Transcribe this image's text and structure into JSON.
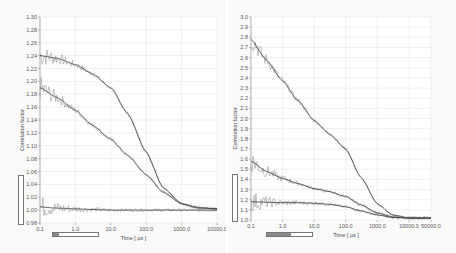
{
  "chart_data": [
    {
      "type": "line",
      "title": "",
      "xlabel": "Time [ µs ]",
      "ylabel": "Correlation factor",
      "xscale": "log",
      "xlim": [
        0.1,
        10000.0
      ],
      "ylim": [
        0.98,
        1.3
      ],
      "grid": true,
      "legend": "none",
      "x_ticks": [
        "0.1",
        "1.0",
        "10.0",
        "100.0",
        "1000.0",
        "10000.0"
      ],
      "y_ticks": [
        "1.30",
        "1.28",
        "1.26",
        "1.24",
        "1.22",
        "1.20",
        "1.18",
        "1.16",
        "1.14",
        "1.12",
        "1.10",
        "1.08",
        "1.06",
        "1.04",
        "1.02",
        "1.00",
        "0.98"
      ],
      "x": [
        0.1,
        0.3,
        1.0,
        3.0,
        10.0,
        30.0,
        100.0,
        300.0,
        1000.0,
        3000.0,
        10000.0
      ],
      "series": [
        {
          "name": "curve A (data + fit)",
          "values": [
            1.24,
            1.236,
            1.226,
            1.212,
            1.19,
            1.15,
            1.09,
            1.035,
            1.01,
            1.003,
            1.002
          ],
          "noisy_data": true
        },
        {
          "name": "curve B (data + fit)",
          "values": [
            1.19,
            1.175,
            1.155,
            1.132,
            1.11,
            1.085,
            1.055,
            1.028,
            1.01,
            1.004,
            1.002
          ],
          "noisy_data": true
        },
        {
          "name": "curve C (data + fit)",
          "values": [
            1.005,
            1.003,
            1.002,
            1.001,
            1.0,
            1.0,
            1.0,
            1.0,
            1.0,
            1.0,
            1.0
          ],
          "noisy_data": true
        }
      ]
    },
    {
      "type": "line",
      "title": "",
      "xlabel": "Time [ µs ]",
      "ylabel": "Correlation factor",
      "xscale": "log",
      "xlim": [
        0.1,
        50000.0
      ],
      "ylim": [
        1.0,
        3.0
      ],
      "grid": true,
      "legend": "none",
      "x_ticks": [
        "0.1",
        "1.0",
        "10.0",
        "100.0",
        "1000.0",
        "10000.0",
        "50000.0"
      ],
      "y_ticks": [
        "3.0",
        "2.9",
        "2.8",
        "2.7",
        "2.6",
        "2.5",
        "2.4",
        "2.3",
        "2.2",
        "2.1",
        "2.0",
        "1.9",
        "1.8",
        "1.7",
        "1.6",
        "1.5",
        "1.4",
        "1.3",
        "1.2",
        "1.1",
        "1.0"
      ],
      "x": [
        0.1,
        0.3,
        1.0,
        3.0,
        10.0,
        30.0,
        100.0,
        300.0,
        1000.0,
        3000.0,
        10000.0,
        50000.0
      ],
      "series": [
        {
          "name": "curve A (data + fit)",
          "values": [
            2.78,
            2.58,
            2.37,
            2.18,
            1.98,
            1.85,
            1.7,
            1.42,
            1.16,
            1.05,
            1.02,
            1.02
          ],
          "noisy_data": true
        },
        {
          "name": "curve B (data + fit)",
          "values": [
            1.58,
            1.48,
            1.41,
            1.36,
            1.31,
            1.28,
            1.23,
            1.15,
            1.07,
            1.03,
            1.02,
            1.02
          ],
          "noisy_data": true
        },
        {
          "name": "curve C (data + fit)",
          "values": [
            1.18,
            1.175,
            1.17,
            1.17,
            1.165,
            1.155,
            1.13,
            1.09,
            1.05,
            1.025,
            1.02,
            1.02
          ],
          "noisy_data": true
        }
      ]
    }
  ],
  "panels": [
    {
      "ylabel": "Correlation factor",
      "xlabel": "Time [ µs ]",
      "x_ticks": [
        "0.1",
        "1.0",
        "10.0",
        "100.0",
        "1000.0",
        "10000.0"
      ],
      "y_ticks": [
        "1.30",
        "1.28",
        "1.26",
        "1.24",
        "1.22",
        "1.20",
        "1.18",
        "1.16",
        "1.14",
        "1.12",
        "1.10",
        "1.08",
        "1.06",
        "1.04",
        "1.02",
        "1.00",
        "0.98"
      ]
    },
    {
      "ylabel": "Correlation factor",
      "xlabel": "Time [ µs ]",
      "x_ticks": [
        "0.1",
        "1.0",
        "10.0",
        "100.0",
        "1000.0",
        "10000.0",
        "50000.0"
      ],
      "y_ticks": [
        "3.0",
        "2.9",
        "2.8",
        "2.7",
        "2.6",
        "2.5",
        "2.4",
        "2.3",
        "2.2",
        "2.1",
        "2.0",
        "1.9",
        "1.8",
        "1.7",
        "1.6",
        "1.5",
        "1.4",
        "1.3",
        "1.2",
        "1.1",
        "1.0"
      ]
    }
  ],
  "colors": {
    "data_line": "#8a8a8a",
    "fit_line": "#3a3a3a",
    "grid": "#e6e6e6",
    "background": "#fafafa"
  }
}
